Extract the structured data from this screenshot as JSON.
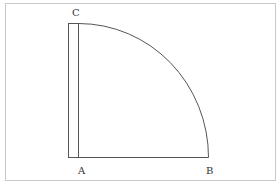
{
  "diagram": {
    "labels": {
      "a": "A",
      "b": "B",
      "c": "C"
    },
    "colors": {
      "frame": "#c8c8c8",
      "line": "#555555",
      "text": "#333333"
    }
  }
}
